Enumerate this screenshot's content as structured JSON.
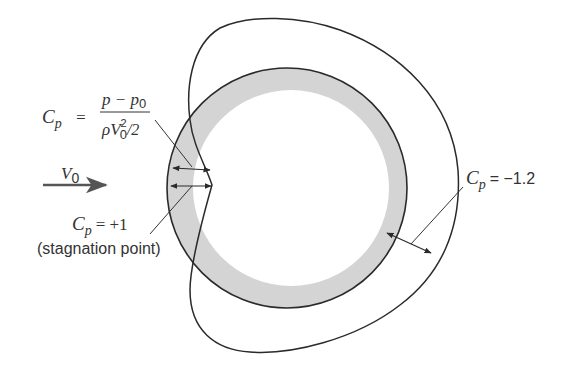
{
  "diagram": {
    "colors": {
      "line": "#2a2a2a",
      "band_fill": "#d4d4d4",
      "background": "#ffffff",
      "arrow": "#444444"
    },
    "freestream": {
      "label_var": "V",
      "label_sub": "0"
    },
    "formula": {
      "lhs_var": "C",
      "lhs_sub": "p",
      "equals": "=",
      "numerator": "p − p",
      "numerator_sub": "0",
      "denominator_rho": "ρV",
      "denominator_sup": "2",
      "denominator_sub": "0",
      "denominator_tail": "/2"
    },
    "stagnation": {
      "lhs_var": "C",
      "lhs_sub": "p",
      "value": "= +1",
      "note": "(stagnation point)"
    },
    "suction": {
      "lhs_var": "C",
      "lhs_sub": "p",
      "value": "= −1.2"
    }
  }
}
